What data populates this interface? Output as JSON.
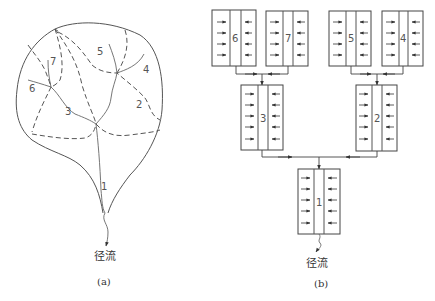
{
  "panel_a": {
    "caption": "(a)",
    "outlet_label": "径流",
    "subbasins": [
      {
        "id": "1",
        "label": "1"
      },
      {
        "id": "2",
        "label": "2"
      },
      {
        "id": "3",
        "label": "3"
      },
      {
        "id": "4",
        "label": "4"
      },
      {
        "id": "5",
        "label": "5"
      },
      {
        "id": "6",
        "label": "6"
      },
      {
        "id": "7",
        "label": "7"
      }
    ]
  },
  "panel_b": {
    "caption": "(b)",
    "outlet_label": "径流",
    "boxes": [
      {
        "id": "6",
        "label": "6",
        "arrows_per_side": 4,
        "flows_to": "3"
      },
      {
        "id": "7",
        "label": "7",
        "arrows_per_side": 4,
        "flows_to": "3"
      },
      {
        "id": "5",
        "label": "5",
        "arrows_per_side": 4,
        "flows_to": "2"
      },
      {
        "id": "4",
        "label": "4",
        "arrows_per_side": 4,
        "flows_to": "2"
      },
      {
        "id": "3",
        "label": "3",
        "arrows_per_side": 5,
        "flows_to": "1"
      },
      {
        "id": "2",
        "label": "2",
        "arrows_per_side": 5,
        "flows_to": "1"
      },
      {
        "id": "1",
        "label": "1",
        "arrows_per_side": 5,
        "flows_to": "outlet"
      }
    ]
  }
}
